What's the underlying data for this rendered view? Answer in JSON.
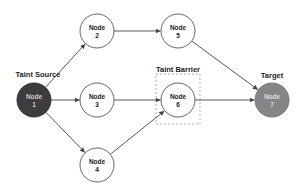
{
  "diagram": {
    "labels": {
      "source": "Taint Source",
      "barrier": "Taint Barrier",
      "target": "Target"
    },
    "nodes": [
      {
        "id": "1",
        "title": "Node",
        "num": "1",
        "cx": 34,
        "cy": 100,
        "fill": "#3d3d3d",
        "text": "#cccccc",
        "stroke": "#2a2a2a"
      },
      {
        "id": "2",
        "title": "Node",
        "num": "2",
        "cx": 97,
        "cy": 31,
        "fill": "#ffffff",
        "text": "#222222",
        "stroke": "#555555"
      },
      {
        "id": "3",
        "title": "Node",
        "num": "3",
        "cx": 97,
        "cy": 100,
        "fill": "#ffffff",
        "text": "#222222",
        "stroke": "#555555"
      },
      {
        "id": "4",
        "title": "Node",
        "num": "4",
        "cx": 97,
        "cy": 165,
        "fill": "#ffffff",
        "text": "#222222",
        "stroke": "#555555"
      },
      {
        "id": "5",
        "title": "Node",
        "num": "5",
        "cx": 178,
        "cy": 31,
        "fill": "#ffffff",
        "text": "#222222",
        "stroke": "#555555"
      },
      {
        "id": "6",
        "title": "Node",
        "num": "6",
        "cx": 178,
        "cy": 100,
        "fill": "#ffffff",
        "text": "#222222",
        "stroke": "#555555"
      },
      {
        "id": "7",
        "title": "Node",
        "num": "7",
        "cx": 272,
        "cy": 100,
        "fill": "#858585",
        "text": "#dddddd",
        "stroke": "#6f6f6f"
      }
    ],
    "edges": [
      {
        "from": "1",
        "to": "2"
      },
      {
        "from": "1",
        "to": "3"
      },
      {
        "from": "1",
        "to": "4"
      },
      {
        "from": "2",
        "to": "5"
      },
      {
        "from": "3",
        "to": "6"
      },
      {
        "from": "4",
        "to": "6"
      },
      {
        "from": "5",
        "to": "7"
      },
      {
        "from": "6",
        "to": "7"
      }
    ],
    "colors": {
      "edge": "#444444",
      "barrier_border": "#999999"
    }
  }
}
